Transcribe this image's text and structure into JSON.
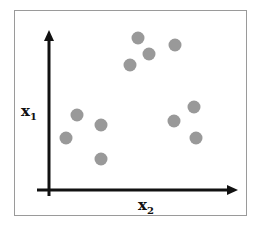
{
  "chart_data": {
    "type": "scatter",
    "title": "",
    "xlabel": "x2",
    "ylabel": "x1",
    "axis_label_x": {
      "base": "x",
      "subscript": "2"
    },
    "axis_label_y": {
      "base": "x",
      "subscript": "1"
    },
    "grid": false,
    "point_color": "#999999",
    "points": [
      {
        "x": 138,
        "y": 38
      },
      {
        "x": 149,
        "y": 54
      },
      {
        "x": 130,
        "y": 65
      },
      {
        "x": 175,
        "y": 45
      },
      {
        "x": 77,
        "y": 115
      },
      {
        "x": 66,
        "y": 138
      },
      {
        "x": 101,
        "y": 125
      },
      {
        "x": 101,
        "y": 159
      },
      {
        "x": 194,
        "y": 107
      },
      {
        "x": 174,
        "y": 121
      },
      {
        "x": 196,
        "y": 138
      }
    ],
    "clusters": 2
  }
}
